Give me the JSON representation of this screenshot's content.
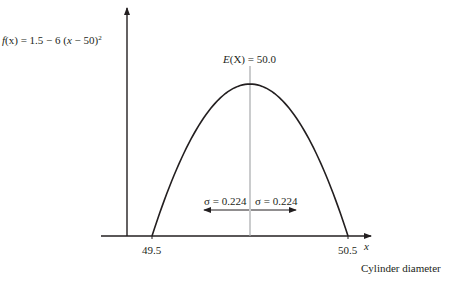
{
  "chart_data": {
    "type": "line",
    "title": "",
    "function_label": {
      "prefix": "f",
      "arg": "(x)",
      "body": " = 1.5 − 6 (",
      "var": "x",
      "rest": " − 50)",
      "exp": "2"
    },
    "function": {
      "a": 1.5,
      "b": 6,
      "center": 50
    },
    "xlabel": "x",
    "xlabel_caption": "Cylinder diameter",
    "xlim": [
      49.35,
      50.75
    ],
    "ylim": [
      0,
      1.85
    ],
    "x_ticks": [
      {
        "value": 49.5,
        "label": "49.5"
      },
      {
        "value": 50.5,
        "label": "50.5"
      }
    ],
    "mean": {
      "value": 50.0,
      "label_prefix": "E",
      "label_arg": "(X)",
      "label_rest": " = 50.0"
    },
    "sigma": {
      "value": 0.224,
      "left_label": "σ = 0.224",
      "right_label": "σ = 0.224",
      "arrow_y": 0.39
    },
    "colors": {
      "curve": "#231f20",
      "mean_line": "#a7a9ac",
      "axes": "#231f20"
    }
  }
}
